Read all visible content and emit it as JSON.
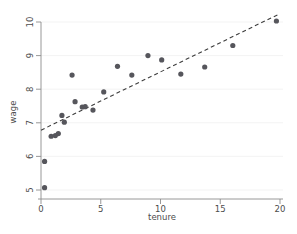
{
  "chart_data": {
    "type": "scatter",
    "title": "",
    "xlabel": "tenure",
    "ylabel": "wage",
    "xlim": [
      -0.6,
      20.6
    ],
    "ylim": [
      4.72,
      10.45
    ],
    "xticks": [
      0,
      5,
      10,
      15,
      20
    ],
    "yticks": [
      5,
      6,
      7,
      8,
      9,
      10
    ],
    "xtick_labels": [
      "0",
      "5",
      "10",
      "15",
      "20"
    ],
    "ytick_labels": [
      "5",
      "6",
      "7",
      "8",
      "9",
      "10"
    ],
    "grid": "horizontal-faint",
    "legend": null,
    "series": [
      {
        "name": "observations",
        "marker": "filled-circle",
        "color": "#56565c",
        "points": [
          {
            "x": 0.3,
            "y": 5.07
          },
          {
            "x": 0.3,
            "y": 5.85
          },
          {
            "x": 0.85,
            "y": 6.6
          },
          {
            "x": 1.2,
            "y": 6.62
          },
          {
            "x": 1.45,
            "y": 6.68
          },
          {
            "x": 1.75,
            "y": 7.22
          },
          {
            "x": 1.95,
            "y": 7.02
          },
          {
            "x": 2.6,
            "y": 8.42
          },
          {
            "x": 2.85,
            "y": 7.63
          },
          {
            "x": 3.45,
            "y": 7.47
          },
          {
            "x": 3.7,
            "y": 7.48
          },
          {
            "x": 4.35,
            "y": 7.38
          },
          {
            "x": 5.25,
            "y": 7.92
          },
          {
            "x": 6.4,
            "y": 8.68
          },
          {
            "x": 7.6,
            "y": 8.42
          },
          {
            "x": 8.95,
            "y": 9.0
          },
          {
            "x": 10.1,
            "y": 8.87
          },
          {
            "x": 11.7,
            "y": 8.45
          },
          {
            "x": 13.7,
            "y": 8.66
          },
          {
            "x": 16.05,
            "y": 9.3
          },
          {
            "x": 19.7,
            "y": 10.03
          }
        ]
      }
    ],
    "fit_line": {
      "name": "linear-fit",
      "style": "dashed",
      "color": "#3d3d3d",
      "x_start": 0.0,
      "y_start": 6.78,
      "x_end": 20.0,
      "y_end": 10.25
    }
  }
}
